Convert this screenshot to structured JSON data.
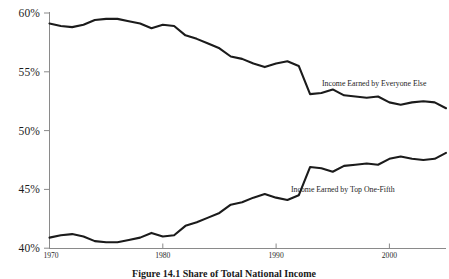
{
  "figure": {
    "caption_number": "Figure 14.1",
    "caption_text": "Share of Total National Income",
    "caption_full": "Figure 14.1  Share of Total National Income"
  },
  "axes": {
    "y_ticks": [
      "60%",
      "55%",
      "50%",
      "45%",
      "40%"
    ],
    "x_ticks": [
      "1970",
      "1980",
      "1990",
      "2000"
    ]
  },
  "annotations": {
    "upper_label": "Income Earned by Everyone Else",
    "lower_label": "Income Earned by Top One-Fifth"
  },
  "colors": {
    "line": "#1b1b1b",
    "axis": "#8a8a8a",
    "background": "#ffffff",
    "text": "#1a1a1a"
  },
  "chart_data": {
    "type": "line",
    "title": "Share of Total National Income",
    "xlabel": "",
    "ylabel": "",
    "xlim": [
      1970,
      2005
    ],
    "ylim": [
      40,
      60
    ],
    "grid": false,
    "legend": "inline-labels",
    "x": [
      1970,
      1971,
      1972,
      1973,
      1974,
      1975,
      1976,
      1977,
      1978,
      1979,
      1980,
      1981,
      1982,
      1983,
      1984,
      1985,
      1986,
      1987,
      1988,
      1989,
      1990,
      1991,
      1992,
      1993,
      1994,
      1995,
      1996,
      1997,
      1998,
      1999,
      2000,
      2001,
      2002,
      2003,
      2004,
      2005
    ],
    "series": [
      {
        "name": "Income Earned by Everyone Else",
        "values": [
          59.1,
          58.9,
          58.8,
          59.0,
          59.4,
          59.5,
          59.5,
          59.3,
          59.1,
          58.7,
          59.0,
          58.9,
          58.1,
          57.8,
          57.4,
          57.0,
          56.3,
          56.1,
          55.7,
          55.4,
          55.7,
          55.9,
          55.5,
          53.1,
          53.2,
          53.5,
          53.0,
          52.9,
          52.8,
          52.9,
          52.4,
          52.2,
          52.4,
          52.5,
          52.4,
          51.9
        ]
      },
      {
        "name": "Income Earned by Top One-Fifth",
        "values": [
          40.9,
          41.1,
          41.2,
          41.0,
          40.6,
          40.5,
          40.5,
          40.7,
          40.9,
          41.3,
          41.0,
          41.1,
          41.9,
          42.2,
          42.6,
          43.0,
          43.7,
          43.9,
          44.3,
          44.6,
          44.3,
          44.1,
          44.5,
          46.9,
          46.8,
          46.5,
          47.0,
          47.1,
          47.2,
          47.1,
          47.6,
          47.8,
          47.6,
          47.5,
          47.6,
          48.1
        ]
      }
    ],
    "annotations": [
      {
        "text": "Income Earned by Everyone Else",
        "near_x": 1994,
        "near_y": 54.0
      },
      {
        "text": "Income Earned by Top One-Fifth",
        "near_x": 1993,
        "near_y": 45.8
      }
    ]
  }
}
